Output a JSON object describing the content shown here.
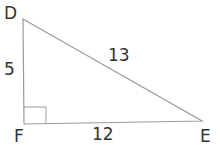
{
  "diagram": {
    "type": "right-triangle",
    "vertices": {
      "D": {
        "label": "D",
        "x": 23,
        "y": 19
      },
      "F": {
        "label": "F",
        "x": 24,
        "y": 124
      },
      "E": {
        "label": "E",
        "x": 202,
        "y": 121
      }
    },
    "sides": {
      "DF": {
        "label": "5"
      },
      "FE": {
        "label": "12"
      },
      "DE": {
        "label": "13"
      }
    },
    "right_angle_at": "F",
    "stroke_color": "#9a9a9a",
    "label_color": "#333333"
  }
}
